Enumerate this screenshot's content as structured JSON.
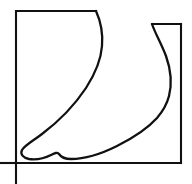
{
  "figure": {
    "title": "Foot Profile Outline",
    "background_color": "#ffffff",
    "stroke_color": "#111111",
    "fill_color": "#ffffff",
    "canvas": {
      "width": 192,
      "height": 184
    }
  },
  "geometry": {
    "main_frame": {
      "name": "bounding-rectangle",
      "left": 16,
      "top": 11,
      "right": 181,
      "bottom": 163,
      "note": "top edge is interrupted by the shin outline at x=96"
    },
    "notch_frame": {
      "name": "upper-right-rectangle",
      "left": 152,
      "top": 24,
      "right": 181,
      "bottom": 163
    },
    "axis_extensions": {
      "vertical_below_baseline": {
        "x": 16,
        "from_y": 163,
        "to_y": 184
      },
      "horizontal_left_of_frame": {
        "y": 163,
        "from_x": 0,
        "to_x": 16
      }
    }
  },
  "paths": {
    "frame_top_left": "M 16 163 L 16 11 L 96 11",
    "frame_notch_top": "M 152 24 L 181 24",
    "frame_right": "M 181 24 L 181 163",
    "frame_bottom": "M 181 163 L 16 163",
    "axis_vertical": "M 16 163 L 16 184",
    "axis_horizontal": "M 0 163 L 16 163",
    "foot_outline": "M 96 11 C 101 22 103 34 102 46 C 101 60 95 74 86 88 C 74 106 58 122 42 134 C 33 141 25 145 22 150 C 20 154 23 158 29 159 C 37 160 45 158 51 155 C 55 153 57 152 59 154 C 61 157 65 159 71 159 C 84 159 101 154 117 146 C 133 138 148 128 157 118 C 163 111 167 104 169 96 C 172 84 171 70 166 56 C 161 43 155 33 152 24"
  },
  "labels": {
    "shin_front": "shin-front-edge",
    "instep": "instep-curve",
    "toe_tip": "toe-tip",
    "ball_of_foot": "ball-of-foot",
    "sole": "sole-curve",
    "heel": "heel-curve",
    "calf_back": "calf-back-edge"
  },
  "chart_data": {
    "type": "line",
    "title": "Foot Profile Outline",
    "xlabel": "",
    "ylabel": "",
    "xlim": [
      0,
      192
    ],
    "ylim": [
      184,
      0
    ],
    "grid": false,
    "legend": "none",
    "series": [
      {
        "name": "foot-outline",
        "closed": false,
        "points": [
          [
            96,
            11
          ],
          [
            101,
            22
          ],
          [
            102,
            46
          ],
          [
            95,
            74
          ],
          [
            86,
            88
          ],
          [
            74,
            106
          ],
          [
            58,
            122
          ],
          [
            42,
            134
          ],
          [
            25,
            145
          ],
          [
            22,
            150
          ],
          [
            29,
            159
          ],
          [
            45,
            158
          ],
          [
            57,
            152
          ],
          [
            65,
            159
          ],
          [
            84,
            159
          ],
          [
            117,
            146
          ],
          [
            148,
            128
          ],
          [
            163,
            111
          ],
          [
            169,
            96
          ],
          [
            171,
            70
          ],
          [
            161,
            43
          ],
          [
            152,
            24
          ]
        ]
      },
      {
        "name": "frame-rectangle",
        "closed": true,
        "points": [
          [
            16,
            11
          ],
          [
            96,
            11
          ],
          [
            181,
            24
          ],
          [
            181,
            163
          ],
          [
            16,
            163
          ]
        ]
      }
    ]
  }
}
